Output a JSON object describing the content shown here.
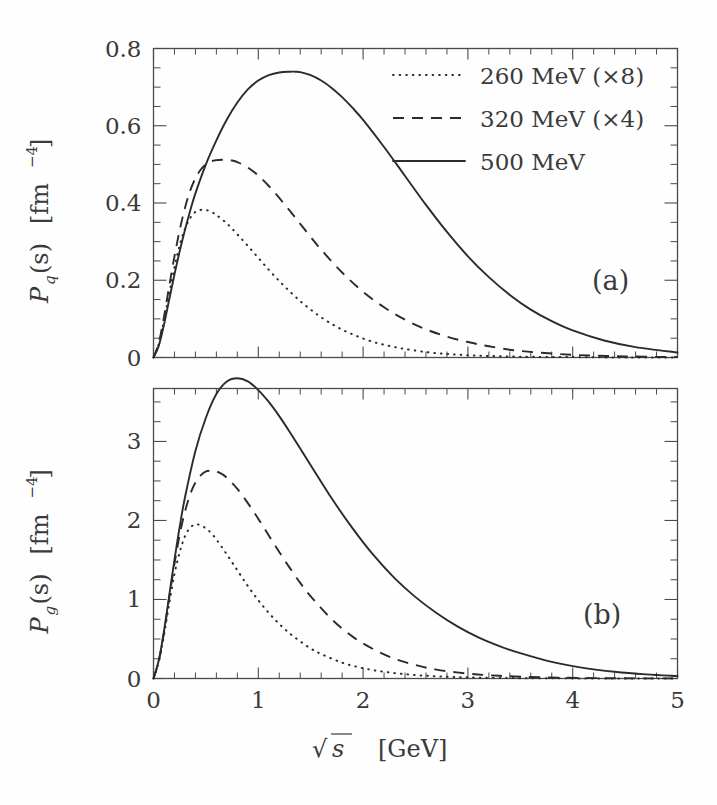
{
  "figure": {
    "xlabel_root": "√",
    "xlabel_var": "s",
    "xlabel_unit": "[GeV]",
    "panels": [
      {
        "id": "a",
        "label": "(a)",
        "ylabel_main": "P",
        "ylabel_sub": "q",
        "ylabel_arg": "(s)",
        "ylabel_unit_open": "[fm",
        "ylabel_unit_exp": "−4",
        "ylabel_unit_close": "]"
      },
      {
        "id": "b",
        "label": "(b)",
        "ylabel_main": "P",
        "ylabel_sub": "g",
        "ylabel_arg": "(s)",
        "ylabel_unit_open": "[fm",
        "ylabel_unit_exp": "−4",
        "ylabel_unit_close": "]"
      }
    ],
    "legend": {
      "entries": [
        {
          "style": "dotted",
          "label": "260 MeV (×8)"
        },
        {
          "style": "dashed",
          "label": "320 MeV (×4)"
        },
        {
          "style": "solid",
          "label": "500 MeV"
        }
      ]
    },
    "colors": {
      "line": "#2b2b2b",
      "axis": "#4a4a4a",
      "background": "#fefefe",
      "text": "#3a3a3a"
    }
  },
  "chart_data": [
    {
      "type": "line",
      "panel": "a",
      "title": "",
      "xlabel": "√s  [GeV]",
      "ylabel": "P_q(s) [fm^-4]",
      "xlim": [
        0,
        5
      ],
      "ylim": [
        0,
        0.8
      ],
      "xticks": [
        0,
        1,
        2,
        3,
        4,
        5
      ],
      "yticks": [
        0,
        0.2,
        0.4,
        0.6,
        0.8
      ],
      "xminor_step": 0.2,
      "yminor_step": 0.05,
      "grid": false,
      "legend_position": "top-right",
      "series": [
        {
          "name": "260 MeV (×8)",
          "style": "dotted",
          "peak_x": 0.5,
          "peak_y": 0.382,
          "x": [
            0.0,
            0.05,
            0.1,
            0.15,
            0.2,
            0.25,
            0.3,
            0.35,
            0.4,
            0.45,
            0.5,
            0.55,
            0.6,
            0.7,
            0.8,
            0.9,
            1.0,
            1.1,
            1.2,
            1.3,
            1.4,
            1.5,
            1.6,
            1.7,
            1.8,
            1.9,
            2.0,
            2.1,
            2.2,
            2.3,
            2.4,
            2.6,
            2.8,
            3.0,
            3.2,
            3.5,
            4.0,
            4.5,
            5.0
          ],
          "y": [
            0.0,
            0.035,
            0.095,
            0.165,
            0.233,
            0.291,
            0.333,
            0.361,
            0.377,
            0.382,
            0.382,
            0.377,
            0.369,
            0.347,
            0.319,
            0.289,
            0.258,
            0.227,
            0.198,
            0.171,
            0.146,
            0.124,
            0.104,
            0.087,
            0.072,
            0.06,
            0.049,
            0.04,
            0.033,
            0.027,
            0.022,
            0.014,
            0.009,
            0.006,
            0.004,
            0.002,
            0.001,
            0.0,
            0.0
          ]
        },
        {
          "name": "320 MeV (×4)",
          "style": "dashed",
          "peak_x": 0.74,
          "peak_y": 0.512,
          "x": [
            0.0,
            0.05,
            0.1,
            0.15,
            0.2,
            0.25,
            0.3,
            0.35,
            0.4,
            0.45,
            0.5,
            0.55,
            0.6,
            0.65,
            0.7,
            0.75,
            0.8,
            0.9,
            1.0,
            1.1,
            1.2,
            1.3,
            1.4,
            1.5,
            1.6,
            1.8,
            2.0,
            2.2,
            2.4,
            2.6,
            2.8,
            3.0,
            3.2,
            3.5,
            4.0,
            4.5,
            5.0
          ],
          "y": [
            0.0,
            0.038,
            0.105,
            0.185,
            0.262,
            0.33,
            0.387,
            0.432,
            0.464,
            0.486,
            0.5,
            0.508,
            0.511,
            0.512,
            0.512,
            0.51,
            0.506,
            0.492,
            0.471,
            0.444,
            0.413,
            0.38,
            0.346,
            0.312,
            0.279,
            0.22,
            0.17,
            0.13,
            0.098,
            0.073,
            0.054,
            0.04,
            0.029,
            0.017,
            0.007,
            0.003,
            0.001
          ]
        },
        {
          "name": "500 MeV",
          "style": "solid",
          "peak_x": 1.35,
          "peak_y": 0.74,
          "x": [
            0.0,
            0.05,
            0.1,
            0.15,
            0.2,
            0.25,
            0.3,
            0.35,
            0.4,
            0.5,
            0.6,
            0.7,
            0.8,
            0.9,
            1.0,
            1.1,
            1.2,
            1.3,
            1.35,
            1.4,
            1.5,
            1.6,
            1.7,
            1.8,
            1.9,
            2.0,
            2.2,
            2.4,
            2.6,
            2.8,
            3.0,
            3.2,
            3.4,
            3.6,
            3.8,
            4.0,
            4.3,
            4.6,
            5.0
          ],
          "y": [
            0.0,
            0.03,
            0.085,
            0.15,
            0.215,
            0.275,
            0.33,
            0.38,
            0.425,
            0.5,
            0.562,
            0.616,
            0.66,
            0.694,
            0.717,
            0.731,
            0.738,
            0.74,
            0.74,
            0.739,
            0.731,
            0.717,
            0.698,
            0.674,
            0.646,
            0.615,
            0.545,
            0.47,
            0.395,
            0.325,
            0.262,
            0.208,
            0.162,
            0.124,
            0.094,
            0.07,
            0.044,
            0.027,
            0.013
          ]
        }
      ]
    },
    {
      "type": "line",
      "panel": "b",
      "title": "",
      "xlabel": "√s  [GeV]",
      "ylabel": "P_g(s) [fm^-4]",
      "xlim": [
        0,
        5
      ],
      "ylim": [
        0,
        3.67
      ],
      "xticks": [
        0,
        1,
        2,
        3,
        4,
        5
      ],
      "yticks": [
        0,
        1,
        2,
        3
      ],
      "xminor_step": 0.2,
      "yminor_step": 0.25,
      "grid": false,
      "legend_position": "none",
      "series": [
        {
          "name": "260 MeV (×8)",
          "style": "dotted",
          "peak_x": 0.42,
          "peak_y": 1.95,
          "x": [
            0.0,
            0.05,
            0.1,
            0.15,
            0.2,
            0.25,
            0.3,
            0.35,
            0.4,
            0.42,
            0.45,
            0.5,
            0.55,
            0.6,
            0.7,
            0.8,
            0.9,
            1.0,
            1.1,
            1.2,
            1.3,
            1.4,
            1.5,
            1.6,
            1.8,
            2.0,
            2.2,
            2.4,
            2.6,
            2.8,
            3.0,
            3.3,
            3.7,
            4.2,
            5.0
          ],
          "y": [
            0.0,
            0.21,
            0.55,
            0.95,
            1.32,
            1.6,
            1.8,
            1.91,
            1.95,
            1.95,
            1.94,
            1.9,
            1.84,
            1.76,
            1.57,
            1.37,
            1.17,
            0.99,
            0.83,
            0.69,
            0.57,
            0.47,
            0.38,
            0.31,
            0.2,
            0.13,
            0.085,
            0.055,
            0.035,
            0.022,
            0.014,
            0.007,
            0.003,
            0.001,
            0.0
          ]
        },
        {
          "name": "320 MeV (×4)",
          "style": "dashed",
          "peak_x": 0.56,
          "peak_y": 2.63,
          "x": [
            0.0,
            0.05,
            0.1,
            0.15,
            0.2,
            0.25,
            0.3,
            0.35,
            0.4,
            0.45,
            0.5,
            0.55,
            0.6,
            0.65,
            0.7,
            0.8,
            0.9,
            1.0,
            1.1,
            1.2,
            1.3,
            1.4,
            1.5,
            1.7,
            1.9,
            2.1,
            2.3,
            2.5,
            2.7,
            3.0,
            3.3,
            3.7,
            4.2,
            4.6,
            5.0
          ],
          "y": [
            0.0,
            0.22,
            0.58,
            1.02,
            1.45,
            1.82,
            2.11,
            2.33,
            2.48,
            2.57,
            2.62,
            2.63,
            2.62,
            2.59,
            2.54,
            2.4,
            2.22,
            2.02,
            1.81,
            1.6,
            1.4,
            1.21,
            1.04,
            0.75,
            0.53,
            0.37,
            0.25,
            0.17,
            0.112,
            0.062,
            0.034,
            0.015,
            0.005,
            0.002,
            0.001
          ]
        },
        {
          "name": "500 MeV",
          "style": "solid",
          "peak_x": 0.8,
          "peak_y": 3.8,
          "x": [
            0.0,
            0.05,
            0.1,
            0.15,
            0.2,
            0.25,
            0.3,
            0.4,
            0.5,
            0.6,
            0.7,
            0.8,
            0.9,
            1.0,
            1.1,
            1.2,
            1.3,
            1.4,
            1.5,
            1.7,
            1.9,
            2.1,
            2.3,
            2.5,
            2.7,
            2.9,
            3.1,
            3.3,
            3.5,
            3.8,
            4.1,
            4.4,
            4.7,
            5.0
          ],
          "y": [
            0.0,
            0.23,
            0.6,
            1.05,
            1.5,
            1.92,
            2.29,
            2.88,
            3.3,
            3.6,
            3.76,
            3.8,
            3.76,
            3.65,
            3.5,
            3.32,
            3.12,
            2.91,
            2.7,
            2.28,
            1.9,
            1.56,
            1.27,
            1.03,
            0.83,
            0.66,
            0.52,
            0.41,
            0.32,
            0.21,
            0.135,
            0.085,
            0.052,
            0.03
          ]
        }
      ]
    }
  ]
}
